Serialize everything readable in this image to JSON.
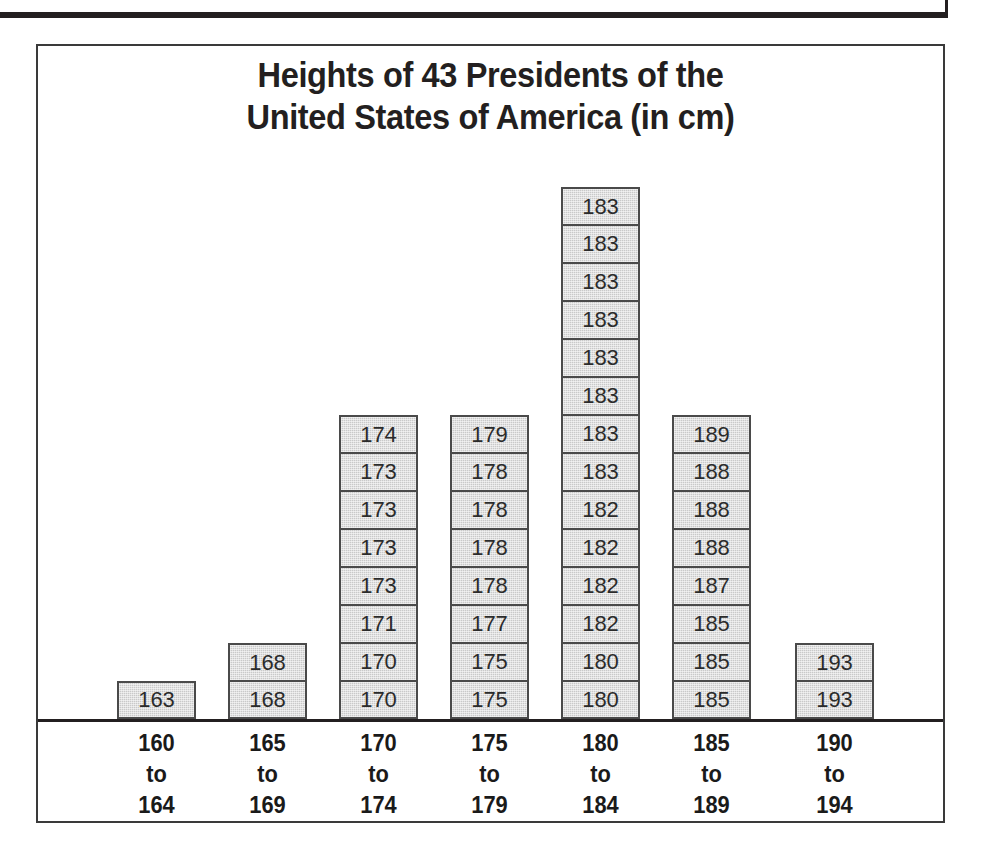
{
  "chart_data": {
    "type": "bar",
    "title": "Heights of 43 Presidents of the\nUnited States of America (in cm)",
    "xlabel": "",
    "ylabel": "",
    "grid": false,
    "legend": "none",
    "total_count": 43,
    "categories": [
      "160 to 164",
      "165 to 169",
      "170 to 174",
      "175 to 179",
      "180 to 184",
      "185 to 189",
      "190 to 194"
    ],
    "values": [
      1,
      2,
      8,
      8,
      14,
      8,
      2
    ],
    "ylim": [
      0,
      14
    ],
    "columns": [
      {
        "range_start": "160",
        "range_to": "to",
        "range_end": "164",
        "count": 1,
        "cells": [
          "163"
        ]
      },
      {
        "range_start": "165",
        "range_to": "to",
        "range_end": "169",
        "count": 2,
        "cells": [
          "168",
          "168"
        ]
      },
      {
        "range_start": "170",
        "range_to": "to",
        "range_end": "174",
        "count": 8,
        "cells": [
          "174",
          "173",
          "173",
          "173",
          "173",
          "171",
          "170",
          "170"
        ]
      },
      {
        "range_start": "175",
        "range_to": "to",
        "range_end": "179",
        "count": 8,
        "cells": [
          "179",
          "178",
          "178",
          "178",
          "178",
          "177",
          "175",
          "175"
        ]
      },
      {
        "range_start": "180",
        "range_to": "to",
        "range_end": "184",
        "count": 14,
        "cells": [
          "183",
          "183",
          "183",
          "183",
          "183",
          "183",
          "183",
          "183",
          "182",
          "182",
          "182",
          "182",
          "180",
          "180"
        ]
      },
      {
        "range_start": "185",
        "range_to": "to",
        "range_end": "189",
        "count": 8,
        "cells": [
          "189",
          "188",
          "188",
          "188",
          "187",
          "185",
          "185",
          "185"
        ]
      },
      {
        "range_start": "190",
        "range_to": "to",
        "range_end": "194",
        "count": 2,
        "cells": [
          "193",
          "193"
        ]
      }
    ],
    "colors": {
      "cell_fill": "#c9c9c9",
      "cell_border": "#4a4a4a",
      "axis": "#231f20",
      "frame": "#3a3a3a",
      "text": "#1a1a1a"
    },
    "layout": {
      "column_left_positions": [
        79,
        190,
        301,
        412,
        523,
        634,
        757
      ],
      "column_width": 79,
      "cell_height": 38
    }
  }
}
